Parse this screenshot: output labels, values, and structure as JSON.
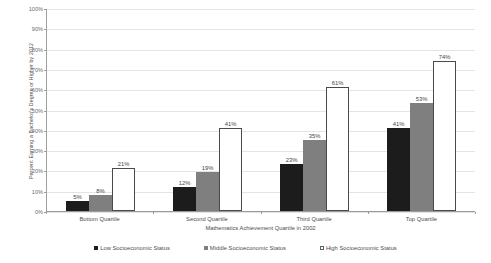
{
  "chart_data": {
    "type": "bar",
    "title": "",
    "xlabel": "Mathematics Achievement Quartile in 2002",
    "ylabel": "Percent Earning a Bachelor's Degree or Higher by 2012",
    "categories": [
      "Bottom Quartile",
      "Second Quartile",
      "Third Quartile",
      "Top Quartile"
    ],
    "series": [
      {
        "name": "Low Socioeconomic Status",
        "values": [
          5,
          12,
          23,
          41
        ],
        "color": "#1c1c1c"
      },
      {
        "name": "Middle Socioeconomic Status",
        "values": [
          8,
          19,
          35,
          53
        ],
        "color": "#7f7f7f"
      },
      {
        "name": "High Socioeconomic Status",
        "values": [
          21,
          41,
          61,
          74
        ],
        "color": "#ffffff"
      }
    ],
    "value_labels": [
      [
        "5%",
        "8%",
        "21%"
      ],
      [
        "12%",
        "19%",
        "41%"
      ],
      [
        "23%",
        "35%",
        "61%"
      ],
      [
        "41%",
        "53%",
        "74%"
      ]
    ],
    "ylim": [
      0,
      100
    ],
    "yticks": [
      0,
      10,
      20,
      30,
      40,
      50,
      60,
      70,
      80,
      90,
      100
    ],
    "ytick_labels": [
      "0%",
      "10%",
      "20%",
      "30%",
      "40%",
      "50%",
      "60%",
      "70%",
      "80%",
      "90%",
      "100%"
    ],
    "grid": true,
    "legend_position": "bottom",
    "units": "percent"
  },
  "legend": {
    "items": [
      {
        "label": "Low Socioeconomic Status"
      },
      {
        "label": "Middle Socioeconomic Status"
      },
      {
        "label": "High Socioeconomic Status"
      }
    ]
  }
}
